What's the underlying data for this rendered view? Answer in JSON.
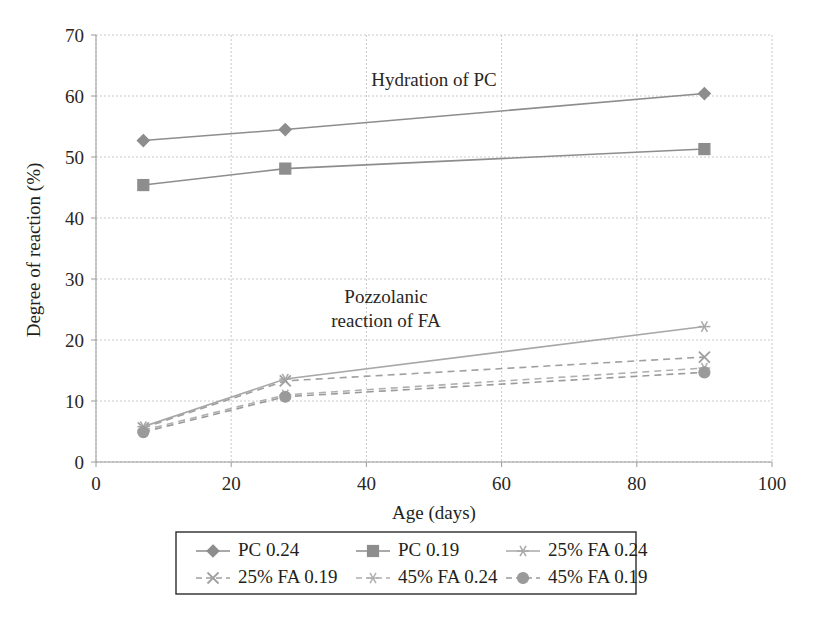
{
  "chart_data": {
    "type": "line",
    "title": "",
    "xlabel": "Age (days)",
    "ylabel": "Degree of reaction (%)",
    "xlim": [
      0,
      100
    ],
    "ylim": [
      0,
      70
    ],
    "xticks": [
      0,
      20,
      40,
      60,
      80,
      100
    ],
    "yticks": [
      0,
      10,
      20,
      30,
      40,
      50,
      60,
      70
    ],
    "grid": true,
    "legend_position": "below-plot",
    "x": [
      7,
      28,
      90
    ],
    "series": [
      {
        "name": "PC 0.24",
        "marker": "diamond",
        "linestyle": "solid",
        "color": "#8d8d8d",
        "values": [
          52.7,
          54.5,
          60.4
        ]
      },
      {
        "name": "PC 0.19",
        "marker": "square",
        "linestyle": "solid",
        "color": "#8d8d8d",
        "values": [
          45.4,
          48.1,
          51.3
        ]
      },
      {
        "name": "25% FA 0.24",
        "marker": "star",
        "linestyle": "solid",
        "color": "#a8a8a8",
        "values": [
          5.8,
          13.6,
          22.2
        ]
      },
      {
        "name": "25% FA 0.19",
        "marker": "cross",
        "linestyle": "dashed",
        "color": "#a0a0a0",
        "values": [
          5.6,
          13.3,
          17.2
        ]
      },
      {
        "name": "45% FA 0.24",
        "marker": "star",
        "linestyle": "dashed",
        "color": "#b0b0b0",
        "values": [
          5.2,
          11.0,
          15.4
        ]
      },
      {
        "name": "45% FA 0.19",
        "marker": "circle",
        "linestyle": "dashed",
        "color": "#9a9a9a",
        "values": [
          4.9,
          10.7,
          14.7
        ]
      }
    ],
    "annotations": [
      {
        "text": "Hydration of PC",
        "x": 46,
        "y": 64.5
      },
      {
        "text": "Pozzolanic",
        "x": 37,
        "y": 31.5
      },
      {
        "text": "reaction of FA",
        "x": 37,
        "y": 28.0
      }
    ]
  },
  "axes": {
    "y_tick_labels": [
      "70",
      "60",
      "50",
      "40",
      "30",
      "20",
      "10",
      "0"
    ],
    "x_tick_labels": [
      "0",
      "20",
      "40",
      "60",
      "80",
      "100"
    ],
    "y_axis_title": "Degree of reaction (%)",
    "x_axis_title": "Age (days)"
  },
  "annotations": {
    "hydration": "Hydration of PC",
    "pozzolanic_line1": "Pozzolanic",
    "pozzolanic_line2": "reaction of FA"
  },
  "legend": {
    "items": [
      {
        "label": "PC 0.24",
        "marker": "diamond-marker-icon",
        "dashed": false
      },
      {
        "label": "PC 0.19",
        "marker": "square-marker-icon",
        "dashed": false
      },
      {
        "label": "25% FA 0.24",
        "marker": "star-marker-icon",
        "dashed": false
      },
      {
        "label": "25% FA 0.19",
        "marker": "cross-marker-icon",
        "dashed": true
      },
      {
        "label": "45% FA 0.24",
        "marker": "star-marker-icon",
        "dashed": true
      },
      {
        "label": "45% FA 0.19",
        "marker": "circle-marker-icon",
        "dashed": true
      }
    ]
  },
  "colors": {
    "gridline": "#c9c9c9",
    "axis": "#9a9a9a",
    "text": "#231f20",
    "series_gray": "#8d8d8d",
    "series_light_gray": "#b0b0b0"
  }
}
